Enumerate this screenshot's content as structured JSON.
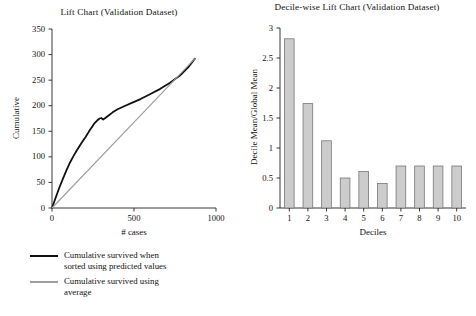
{
  "chart_data": [
    {
      "type": "line",
      "title": "Lift Chart (Validation Dataset)",
      "xlabel": "# cases",
      "ylabel": "Cumulative",
      "xlim": [
        0,
        1000
      ],
      "ylim": [
        0,
        350
      ],
      "xticks": [
        "0",
        "500",
        "1000"
      ],
      "xtick_values": [
        0,
        500,
        1000
      ],
      "yticks": [
        "0",
        "50",
        "100",
        "150",
        "200",
        "250",
        "300",
        "350"
      ],
      "ytick_values": [
        0,
        50,
        100,
        150,
        200,
        250,
        300,
        350
      ],
      "grid": false,
      "legend_position": "below-left",
      "series": [
        {
          "name": "Cumulative survived when sorted using predicted values",
          "color": "#111111",
          "width": 1.8,
          "x": [
            0,
            20,
            45,
            70,
            90,
            110,
            130,
            150,
            170,
            190,
            205,
            215,
            230,
            245,
            260,
            275,
            290,
            300,
            312,
            325,
            345,
            370,
            400,
            440,
            490,
            540,
            600,
            660,
            720,
            780,
            830,
            871
          ],
          "y": [
            0,
            18,
            40,
            60,
            75,
            89,
            101,
            112,
            122,
            132,
            139,
            144,
            152,
            159,
            166,
            171,
            175,
            176,
            173,
            176,
            181,
            187,
            193,
            199,
            206,
            213,
            223,
            233,
            245,
            259,
            275,
            292
          ]
        },
        {
          "name": "Cumulative survived using average",
          "color": "#9e9e9e",
          "width": 1.1,
          "x": [
            0,
            871
          ],
          "y": [
            0,
            292
          ]
        }
      ]
    },
    {
      "type": "bar",
      "title": "Decile-wise Lift Chart (Validation Dataset)",
      "xlabel": "Deciles",
      "ylabel": "Decile Mean/Global Mean",
      "ylim": [
        0,
        3
      ],
      "yticks": [
        "0",
        "0.5",
        "1",
        "1.5",
        "2",
        "2.5",
        "3"
      ],
      "ytick_values": [
        0,
        0.5,
        1,
        1.5,
        2,
        2.5,
        3
      ],
      "categories": [
        "1",
        "2",
        "3",
        "4",
        "5",
        "6",
        "7",
        "8",
        "9",
        "10"
      ],
      "values": [
        2.82,
        1.74,
        1.12,
        0.5,
        0.61,
        0.41,
        0.7,
        0.7,
        0.7,
        0.7
      ],
      "bar_fill": "#cccccc",
      "bar_stroke": "#777777",
      "grid": false
    }
  ],
  "legend": {
    "items": [
      {
        "label_line1": "Cumulative survived when",
        "label_line2": "sorted using predicted values",
        "color": "#111111"
      },
      {
        "label_line1": "Cumulative survived using",
        "label_line2": "average",
        "color": "#9e9e9e"
      }
    ]
  }
}
